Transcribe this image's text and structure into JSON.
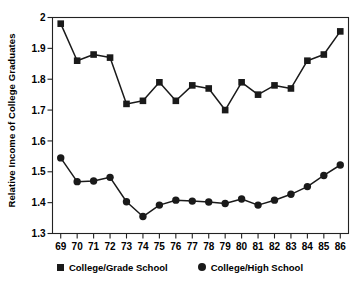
{
  "chart_data": {
    "type": "line",
    "title": "",
    "xlabel": "",
    "ylabel": "Relative Income of College Graduates",
    "x": [
      69,
      70,
      71,
      72,
      73,
      74,
      75,
      76,
      77,
      78,
      79,
      80,
      81,
      82,
      83,
      84,
      85,
      86
    ],
    "xtick_labels": [
      "69",
      "70",
      "71",
      "72",
      "73",
      "74",
      "75",
      "76",
      "77",
      "78",
      "79",
      "80",
      "81",
      "82",
      "83",
      "84",
      "85",
      "86"
    ],
    "ytick_labels": [
      "1.3",
      "1.4",
      "1.5",
      "1.6",
      "1.7",
      "1.8",
      "1.9",
      "2"
    ],
    "yticks": [
      1.3,
      1.4,
      1.5,
      1.6,
      1.7,
      1.8,
      1.9,
      2.0
    ],
    "ylim": [
      1.3,
      2.0
    ],
    "xlim": [
      68.5,
      86.5
    ],
    "grid": false,
    "legend_position": "bottom",
    "series": [
      {
        "name": "College/Grade School",
        "marker": "square",
        "color": "#1a1a1a",
        "values": [
          1.98,
          1.86,
          1.88,
          1.87,
          1.72,
          1.73,
          1.79,
          1.73,
          1.78,
          1.77,
          1.7,
          1.79,
          1.75,
          1.78,
          1.77,
          1.86,
          1.88,
          1.955
        ]
      },
      {
        "name": "College/High School",
        "marker": "circle",
        "color": "#1a1a1a",
        "values": [
          1.545,
          1.468,
          1.47,
          1.482,
          1.403,
          1.355,
          1.392,
          1.408,
          1.405,
          1.402,
          1.397,
          1.412,
          1.392,
          1.408,
          1.427,
          1.452,
          1.488,
          1.522
        ]
      }
    ]
  },
  "legend": {
    "items": [
      {
        "label": "College/Grade School",
        "marker": "square"
      },
      {
        "label": "College/High School",
        "marker": "circle"
      }
    ]
  },
  "axis": {
    "y_title": "Relative Income of College Graduates"
  }
}
